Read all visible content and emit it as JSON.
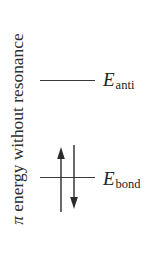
{
  "diagram": {
    "axis_label": {
      "symbol": "π",
      "text": " energy without resonance"
    },
    "levels": [
      {
        "id": "antibonding",
        "symbol": "E",
        "subscript": "anti",
        "electrons": 0
      },
      {
        "id": "bonding",
        "symbol": "E",
        "subscript": "bond",
        "electrons": 2,
        "spins": [
          "up",
          "down"
        ]
      }
    ],
    "colors": {
      "line": "#3a3a3a",
      "text": "#222222",
      "background": "#ffffff"
    }
  }
}
